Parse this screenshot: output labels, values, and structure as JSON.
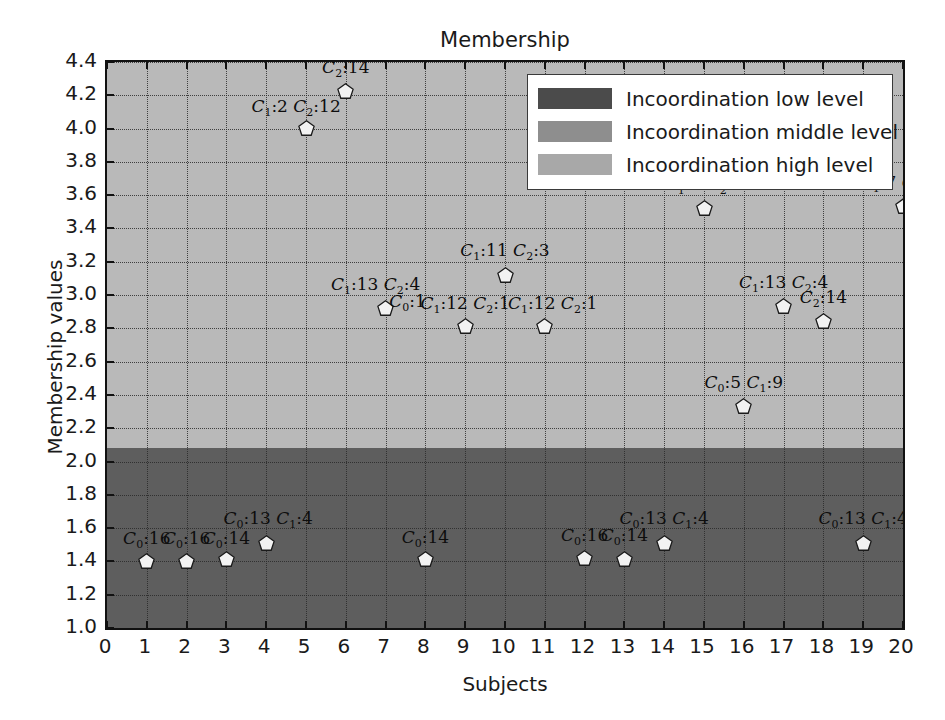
{
  "chart_data": {
    "type": "scatter",
    "title": "Membership",
    "xlabel": "Subjects",
    "ylabel": "Membership values",
    "xlim": [
      0,
      20
    ],
    "ylim": [
      1.0,
      4.4
    ],
    "xticks": [
      "0",
      "1",
      "2",
      "3",
      "4",
      "5",
      "6",
      "7",
      "8",
      "9",
      "10",
      "11",
      "12",
      "13",
      "14",
      "15",
      "16",
      "17",
      "18",
      "19",
      "20"
    ],
    "yticks": [
      "1.0",
      "1.2",
      "1.4",
      "1.6",
      "1.8",
      "2.0",
      "2.2",
      "2.4",
      "2.6",
      "2.8",
      "3.0",
      "3.2",
      "3.4",
      "3.6",
      "3.8",
      "4.0",
      "4.2",
      "4.4"
    ],
    "grid": true,
    "legend_position": "upper right",
    "bands": [
      {
        "name": "Incoordination low level",
        "ymin": 1.0,
        "ymax": 2.08,
        "color": "#5e5e5e"
      },
      {
        "name": "Incoordination middle level",
        "ymin": 2.08,
        "ymax": 4.4,
        "color": "#b9b9b9"
      },
      {
        "name": "Incoordination high level",
        "ymin": 4.4,
        "ymax": 4.4,
        "color": "#a3a3a3"
      }
    ],
    "legend": [
      {
        "label": "Incoordination low level",
        "color": "#4b4b4b"
      },
      {
        "label": "Incoordination middle level",
        "color": "#8e8e8e"
      },
      {
        "label": "Incoordination high level",
        "color": "#a8a8a8"
      }
    ],
    "points": [
      {
        "x": 1,
        "y": 1.4
      },
      {
        "x": 2,
        "y": 1.4
      },
      {
        "x": 3,
        "y": 1.41
      },
      {
        "x": 4,
        "y": 1.51
      },
      {
        "x": 5,
        "y": 4.0
      },
      {
        "x": 6,
        "y": 4.22
      },
      {
        "x": 7,
        "y": 2.92
      },
      {
        "x": 8,
        "y": 1.41
      },
      {
        "x": 9,
        "y": 2.81
      },
      {
        "x": 10,
        "y": 3.12
      },
      {
        "x": 11,
        "y": 2.81
      },
      {
        "x": 12,
        "y": 1.42
      },
      {
        "x": 13,
        "y": 1.41
      },
      {
        "x": 14,
        "y": 1.51
      },
      {
        "x": 15,
        "y": 3.52
      },
      {
        "x": 16,
        "y": 2.33
      },
      {
        "x": 17,
        "y": 2.93
      },
      {
        "x": 18,
        "y": 2.84
      },
      {
        "x": 19,
        "y": 1.51
      },
      {
        "x": 20,
        "y": 3.53
      }
    ],
    "annotations": [
      {
        "text": "C0 :16",
        "x": 1,
        "y": 1.46,
        "parts": [
          {
            "c": "C",
            "s": "0",
            "v": ":16"
          }
        ]
      },
      {
        "text": "C0 :16",
        "x": 2,
        "y": 1.46,
        "parts": [
          {
            "c": "C",
            "s": "0",
            "v": ":16"
          }
        ]
      },
      {
        "text": "C0 :14",
        "x": 3,
        "y": 1.46,
        "parts": [
          {
            "c": "C",
            "s": "0",
            "v": ":14"
          }
        ]
      },
      {
        "text": "C0 :13 C1 :4",
        "x": 4.05,
        "y": 1.58,
        "parts": [
          {
            "c": "C",
            "s": "0",
            "v": ":13"
          },
          {
            "c": "C",
            "s": "1",
            "v": ":4"
          }
        ]
      },
      {
        "text": "C1 :2 C2 :12",
        "x": 4.75,
        "y": 4.06,
        "parts": [
          {
            "c": "C",
            "s": "1",
            "v": ":2"
          },
          {
            "c": "C",
            "s": "2",
            "v": ":12"
          }
        ]
      },
      {
        "text": "C2 :14",
        "x": 6.0,
        "y": 4.29,
        "parts": [
          {
            "c": "C",
            "s": "2",
            "v": ":14"
          }
        ]
      },
      {
        "text": "C1 :13 C2 :4",
        "x": 6.75,
        "y": 2.99,
        "parts": [
          {
            "c": "C",
            "s": "1",
            "v": ":13"
          },
          {
            "c": "C",
            "s": "2",
            "v": ":4"
          }
        ]
      },
      {
        "text": "C0 :1",
        "x": 7.55,
        "y": 2.885,
        "parts": [
          {
            "c": "C",
            "s": "0",
            "v": ":1"
          }
        ]
      },
      {
        "text": "C0 :14",
        "x": 8.0,
        "y": 1.47,
        "parts": [
          {
            "c": "C",
            "s": "0",
            "v": ":14"
          }
        ]
      },
      {
        "text": "C1 :12 C2 :1",
        "x": 9.0,
        "y": 2.875,
        "parts": [
          {
            "c": "C",
            "s": "1",
            "v": ":12"
          },
          {
            "c": "C",
            "s": "2",
            "v": ":1"
          }
        ]
      },
      {
        "text": "C1 :11 C2 :3",
        "x": 10.0,
        "y": 3.19,
        "parts": [
          {
            "c": "C",
            "s": "1",
            "v": ":11"
          },
          {
            "c": "C",
            "s": "2",
            "v": ":3"
          }
        ]
      },
      {
        "text": "C1 :12 C2 :1",
        "x": 11.2,
        "y": 2.875,
        "parts": [
          {
            "c": "C",
            "s": "1",
            "v": ":12"
          },
          {
            "c": "C",
            "s": "2",
            "v": ":1"
          }
        ]
      },
      {
        "text": "C0 :16",
        "x": 12.0,
        "y": 1.48,
        "parts": [
          {
            "c": "C",
            "s": "0",
            "v": ":16"
          }
        ]
      },
      {
        "text": "C0 :14",
        "x": 13.0,
        "y": 1.48,
        "parts": [
          {
            "c": "C",
            "s": "0",
            "v": ":14"
          }
        ]
      },
      {
        "text": "C0 :13 C1 :4",
        "x": 14.0,
        "y": 1.58,
        "parts": [
          {
            "c": "C",
            "s": "0",
            "v": ":13"
          },
          {
            "c": "C",
            "s": "1",
            "v": ":4"
          }
        ]
      },
      {
        "text": "C1 :7 C2 :7",
        "x": 15.0,
        "y": 3.59,
        "parts": [
          {
            "c": "C",
            "s": "1",
            "v": ":7"
          },
          {
            "c": "C",
            "s": "2",
            "v": ":7"
          }
        ]
      },
      {
        "text": "C0 :5 C1 :9",
        "x": 16.0,
        "y": 2.4,
        "parts": [
          {
            "c": "C",
            "s": "0",
            "v": ":5"
          },
          {
            "c": "C",
            "s": "1",
            "v": ":9"
          }
        ]
      },
      {
        "text": "C1 :13 C2 :4",
        "x": 17.0,
        "y": 3.0,
        "parts": [
          {
            "c": "C",
            "s": "1",
            "v": ":13"
          },
          {
            "c": "C",
            "s": "2",
            "v": ":4"
          }
        ]
      },
      {
        "text": "C2 :14",
        "x": 18.0,
        "y": 2.91,
        "parts": [
          {
            "c": "C",
            "s": "2",
            "v": ":14"
          }
        ]
      },
      {
        "text": "C0 :13 C1 :4",
        "x": 19.0,
        "y": 1.58,
        "parts": [
          {
            "c": "C",
            "s": "0",
            "v": ":13"
          },
          {
            "c": "C",
            "s": "1",
            "v": ":4"
          }
        ]
      },
      {
        "text": "C1 :7 C2 :7",
        "x": 19.9,
        "y": 3.6,
        "parts": [
          {
            "c": "C",
            "s": "1",
            "v": ":7"
          },
          {
            "c": "C",
            "s": "2",
            "v": ":7"
          }
        ]
      }
    ]
  }
}
